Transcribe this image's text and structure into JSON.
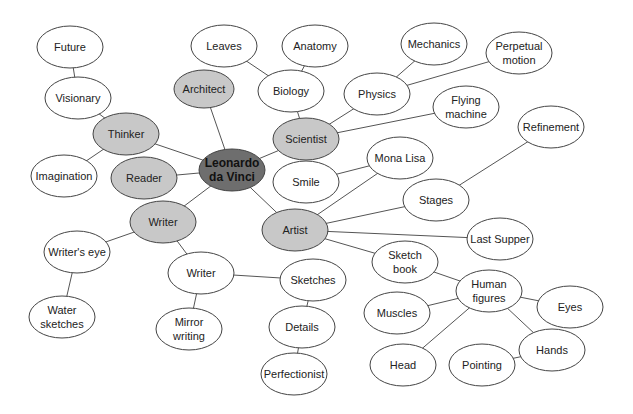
{
  "colors": {
    "center_fill": "#6e6e6e",
    "branch_fill": "#c8c8c8",
    "leaf_fill": "#ffffff",
    "stroke": "#444444",
    "edge": "#555555"
  },
  "nodes": [
    {
      "id": "leonardo",
      "lines": [
        "Leonardo",
        "da Vinci"
      ],
      "x": 232,
      "y": 170,
      "rx": 33,
      "ry": 21,
      "type": "center"
    },
    {
      "id": "future",
      "lines": [
        "Future"
      ],
      "x": 70,
      "y": 47,
      "rx": 33,
      "ry": 21,
      "type": "leaf"
    },
    {
      "id": "visionary",
      "lines": [
        "Visionary"
      ],
      "x": 78,
      "y": 98,
      "rx": 33,
      "ry": 21,
      "type": "leaf"
    },
    {
      "id": "thinker",
      "lines": [
        "Thinker"
      ],
      "x": 126,
      "y": 134,
      "rx": 33,
      "ry": 21,
      "type": "branch"
    },
    {
      "id": "imagination",
      "lines": [
        "Imagination"
      ],
      "x": 64,
      "y": 176,
      "rx": 33,
      "ry": 21,
      "type": "leaf"
    },
    {
      "id": "reader",
      "lines": [
        "Reader"
      ],
      "x": 144,
      "y": 178,
      "rx": 33,
      "ry": 21,
      "type": "branch"
    },
    {
      "id": "architect",
      "lines": [
        "Architect"
      ],
      "x": 204,
      "y": 89,
      "rx": 30,
      "ry": 19,
      "type": "branch"
    },
    {
      "id": "leaves",
      "lines": [
        "Leaves"
      ],
      "x": 224,
      "y": 46,
      "rx": 33,
      "ry": 21,
      "type": "leaf"
    },
    {
      "id": "anatomy",
      "lines": [
        "Anatomy"
      ],
      "x": 315,
      "y": 46,
      "rx": 33,
      "ry": 21,
      "type": "leaf"
    },
    {
      "id": "biology",
      "lines": [
        "Biology"
      ],
      "x": 291,
      "y": 91,
      "rx": 33,
      "ry": 21,
      "type": "leaf"
    },
    {
      "id": "scientist",
      "lines": [
        "Scientist"
      ],
      "x": 306,
      "y": 139,
      "rx": 33,
      "ry": 21,
      "type": "branch"
    },
    {
      "id": "mechanics",
      "lines": [
        "Mechanics"
      ],
      "x": 434,
      "y": 44,
      "rx": 33,
      "ry": 21,
      "type": "leaf"
    },
    {
      "id": "perpetual",
      "lines": [
        "Perpetual",
        "motion"
      ],
      "x": 519,
      "y": 53,
      "rx": 33,
      "ry": 21,
      "type": "leaf"
    },
    {
      "id": "physics",
      "lines": [
        "Physics"
      ],
      "x": 377,
      "y": 94,
      "rx": 33,
      "ry": 21,
      "type": "leaf"
    },
    {
      "id": "flying",
      "lines": [
        "Flying",
        "machine"
      ],
      "x": 466,
      "y": 107,
      "rx": 33,
      "ry": 21,
      "type": "leaf"
    },
    {
      "id": "refinement",
      "lines": [
        "Refinement"
      ],
      "x": 551,
      "y": 127,
      "rx": 33,
      "ry": 21,
      "type": "leaf"
    },
    {
      "id": "monalisa",
      "lines": [
        "Mona Lisa"
      ],
      "x": 400,
      "y": 158,
      "rx": 33,
      "ry": 21,
      "type": "leaf"
    },
    {
      "id": "smile",
      "lines": [
        "Smile"
      ],
      "x": 306,
      "y": 182,
      "rx": 33,
      "ry": 21,
      "type": "leaf"
    },
    {
      "id": "stages",
      "lines": [
        "Stages"
      ],
      "x": 436,
      "y": 200,
      "rx": 33,
      "ry": 21,
      "type": "leaf"
    },
    {
      "id": "writer1",
      "lines": [
        "Writer"
      ],
      "x": 163,
      "y": 222,
      "rx": 33,
      "ry": 21,
      "type": "branch"
    },
    {
      "id": "artist",
      "lines": [
        "Artist"
      ],
      "x": 295,
      "y": 230,
      "rx": 33,
      "ry": 21,
      "type": "branch"
    },
    {
      "id": "lastsupper",
      "lines": [
        "Last Supper"
      ],
      "x": 500,
      "y": 239,
      "rx": 33,
      "ry": 21,
      "type": "leaf"
    },
    {
      "id": "writerseye",
      "lines": [
        "Writer's eye"
      ],
      "x": 77,
      "y": 252,
      "rx": 33,
      "ry": 21,
      "type": "leaf"
    },
    {
      "id": "writer2",
      "lines": [
        "Writer"
      ],
      "x": 201,
      "y": 273,
      "rx": 33,
      "ry": 21,
      "type": "leaf"
    },
    {
      "id": "sketches",
      "lines": [
        "Sketches"
      ],
      "x": 313,
      "y": 280,
      "rx": 33,
      "ry": 21,
      "type": "leaf"
    },
    {
      "id": "sketchbook",
      "lines": [
        "Sketch",
        "book"
      ],
      "x": 405,
      "y": 262,
      "rx": 33,
      "ry": 21,
      "type": "leaf"
    },
    {
      "id": "humanfigures",
      "lines": [
        "Human",
        "figures"
      ],
      "x": 489,
      "y": 291,
      "rx": 33,
      "ry": 21,
      "type": "leaf"
    },
    {
      "id": "eyes",
      "lines": [
        "Eyes"
      ],
      "x": 570,
      "y": 307,
      "rx": 33,
      "ry": 21,
      "type": "leaf"
    },
    {
      "id": "muscles",
      "lines": [
        "Muscles"
      ],
      "x": 397,
      "y": 313,
      "rx": 33,
      "ry": 21,
      "type": "leaf"
    },
    {
      "id": "water",
      "lines": [
        "Water",
        "sketches"
      ],
      "x": 62,
      "y": 317,
      "rx": 33,
      "ry": 21,
      "type": "leaf"
    },
    {
      "id": "mirror",
      "lines": [
        "Mirror",
        "writing"
      ],
      "x": 189,
      "y": 329,
      "rx": 33,
      "ry": 21,
      "type": "leaf"
    },
    {
      "id": "details",
      "lines": [
        "Details"
      ],
      "x": 302,
      "y": 327,
      "rx": 33,
      "ry": 21,
      "type": "leaf"
    },
    {
      "id": "hands",
      "lines": [
        "Hands"
      ],
      "x": 552,
      "y": 350,
      "rx": 33,
      "ry": 21,
      "type": "leaf"
    },
    {
      "id": "head",
      "lines": [
        "Head"
      ],
      "x": 403,
      "y": 365,
      "rx": 33,
      "ry": 21,
      "type": "leaf"
    },
    {
      "id": "pointing",
      "lines": [
        "Pointing"
      ],
      "x": 482,
      "y": 365,
      "rx": 33,
      "ry": 21,
      "type": "leaf"
    },
    {
      "id": "perfectionist",
      "lines": [
        "Perfectionist"
      ],
      "x": 294,
      "y": 374,
      "rx": 33,
      "ry": 21,
      "type": "leaf"
    }
  ],
  "edges": [
    [
      "future",
      "visionary"
    ],
    [
      "visionary",
      "thinker"
    ],
    [
      "thinker",
      "imagination"
    ],
    [
      "thinker",
      "leonardo"
    ],
    [
      "reader",
      "leonardo"
    ],
    [
      "architect",
      "leonardo"
    ],
    [
      "leaves",
      "biology"
    ],
    [
      "anatomy",
      "biology"
    ],
    [
      "biology",
      "scientist"
    ],
    [
      "scientist",
      "leonardo"
    ],
    [
      "scientist",
      "physics"
    ],
    [
      "scientist",
      "flying"
    ],
    [
      "physics",
      "mechanics"
    ],
    [
      "physics",
      "perpetual"
    ],
    [
      "leonardo",
      "writer1"
    ],
    [
      "leonardo",
      "artist"
    ],
    [
      "writer1",
      "writerseye"
    ],
    [
      "writerseye",
      "water"
    ],
    [
      "writer1",
      "writer2"
    ],
    [
      "writer2",
      "mirror"
    ],
    [
      "writer2",
      "sketches"
    ],
    [
      "sketches",
      "details"
    ],
    [
      "details",
      "perfectionist"
    ],
    [
      "artist",
      "monalisa"
    ],
    [
      "monalisa",
      "smile"
    ],
    [
      "artist",
      "stages"
    ],
    [
      "stages",
      "refinement"
    ],
    [
      "artist",
      "lastsupper"
    ],
    [
      "artist",
      "sketchbook"
    ],
    [
      "sketchbook",
      "humanfigures"
    ],
    [
      "humanfigures",
      "muscles"
    ],
    [
      "humanfigures",
      "head"
    ],
    [
      "humanfigures",
      "eyes"
    ],
    [
      "humanfigures",
      "hands"
    ],
    [
      "hands",
      "pointing"
    ]
  ]
}
